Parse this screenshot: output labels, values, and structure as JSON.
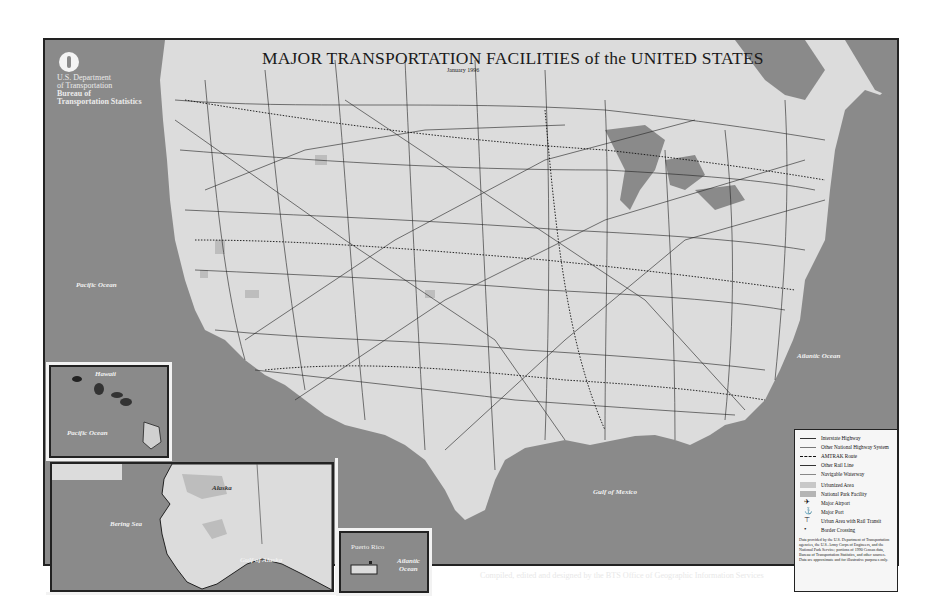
{
  "map": {
    "title": "MAJOR TRANSPORTATION FACILITIES of the UNITED STATES",
    "date": "January 1996",
    "agency": {
      "line1": "U.S. Department",
      "line2": "of Transportation",
      "line3": "Bureau of",
      "line4": "Transportation Statistics"
    },
    "labels": {
      "pacific_ocean": "Pacific Ocean",
      "atlantic_ocean": "Atlantic Ocean",
      "gulf_of_mexico": "Gulf of Mexico"
    },
    "insets": {
      "hawaii": {
        "name": "Hawaii",
        "ocean": "Pacific Ocean"
      },
      "alaska": {
        "name": "Alaska",
        "sea": "Bering Sea",
        "gulf": "Gulf of Alaska"
      },
      "puerto_rico": {
        "name": "Puerto Rico",
        "ocean_line1": "Atlantic",
        "ocean_line2": "Ocean"
      }
    },
    "legend": {
      "items": [
        {
          "label": "Interstate Highway",
          "symbol": "line"
        },
        {
          "label": "Other National Highway System",
          "symbol": "thin-line"
        },
        {
          "label": "AMTRAK Route",
          "symbol": "dashed-line"
        },
        {
          "label": "Other Rail Line",
          "symbol": "line"
        },
        {
          "label": "Navigable Waterway",
          "symbol": "thin-line"
        },
        {
          "label": "Urbanized Area",
          "symbol": "swatch"
        },
        {
          "label": "National Park Facility",
          "symbol": "swatch"
        },
        {
          "label": "Major Airport",
          "symbol": "airplane"
        },
        {
          "label": "Major Port",
          "symbol": "anchor"
        },
        {
          "label": "Urban Area with Rail Transit",
          "symbol": "transit"
        },
        {
          "label": "Border Crossing",
          "symbol": "dot"
        }
      ],
      "note": "Data provided by the U.S. Department of Transportation agencies, the U.S. Army Corps of Engineers, and the National Park Service; portions of 1990 Census data, Bureau of Transportation Statistics, and other sources. Data are approximate and for illustrative purposes only."
    },
    "credit": "Compiled, edited and designed by the BTS Office of Geographic Information Services",
    "colors": {
      "ocean": "#8a8a8a",
      "land": "#dcdcdc",
      "border": "#222222",
      "urban": "#bdbdbd"
    }
  }
}
